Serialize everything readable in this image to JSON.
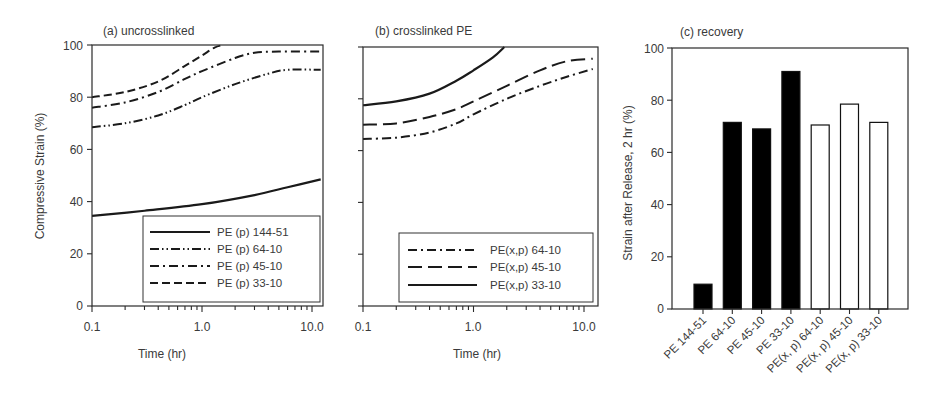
{
  "chart_data": [
    {
      "panel": "a",
      "type": "line",
      "title": "(a) uncrosslinked",
      "xlabel": "Time (hr)",
      "ylabel": "Compressive Strain (%)",
      "xscale": "log",
      "xlim": [
        0.1,
        12.6
      ],
      "ylim": [
        0,
        100
      ],
      "xticks": [
        "0.1",
        "1.0",
        "10.0"
      ],
      "yticks": [
        "0",
        "20",
        "40",
        "60",
        "80",
        "100"
      ],
      "grid": false,
      "legend_position": "lower right",
      "series": [
        {
          "name": "PE (p) 144-51",
          "style": "solid",
          "x": [
            0.1,
            0.3,
            1.0,
            3.0,
            6.0,
            12.0
          ],
          "y": [
            34.5,
            36.5,
            39,
            42.5,
            45.5,
            48.5
          ]
        },
        {
          "name": "PE (p) 64-10",
          "style": "dash-dot-dot",
          "x": [
            0.1,
            0.2,
            0.4,
            0.7,
            1.0,
            2.0,
            4.0,
            6.0,
            12.0
          ],
          "y": [
            68.5,
            70,
            73,
            77,
            80,
            85,
            89,
            90.5,
            90.5
          ]
        },
        {
          "name": "PE (p) 45-10",
          "style": "dash-dot",
          "x": [
            0.1,
            0.2,
            0.4,
            0.7,
            1.0,
            2.0,
            3.0,
            5.0,
            12.0
          ],
          "y": [
            76,
            78,
            82,
            87,
            90,
            95,
            97,
            97.5,
            97.5
          ]
        },
        {
          "name": "PE (p) 33-10",
          "style": "dashed",
          "x": [
            0.1,
            0.2,
            0.4,
            0.7,
            1.0,
            1.3,
            1.55
          ],
          "y": [
            80,
            82,
            86,
            92,
            96,
            99,
            100
          ]
        }
      ]
    },
    {
      "panel": "b",
      "type": "line",
      "title": "(b) crosslinked PE",
      "xlabel": "Time (hr)",
      "ylabel": "",
      "xscale": "log",
      "xlim": [
        0.1,
        13.4
      ],
      "ylim": [
        0,
        100
      ],
      "xticks": [
        "0.1",
        "1.0",
        "10.0"
      ],
      "grid": false,
      "legend_position": "lower right",
      "series": [
        {
          "name": "PE(x,p) 64-10",
          "style": "dash-dot",
          "x": [
            0.1,
            0.2,
            0.4,
            0.7,
            1.0,
            2.0,
            4.0,
            7.0,
            12.0
          ],
          "y": [
            64.5,
            65,
            67,
            70.5,
            74,
            80,
            85,
            88.5,
            91.5
          ]
        },
        {
          "name": "PE(x,p) 45-10",
          "style": "long-dash",
          "x": [
            0.1,
            0.2,
            0.4,
            0.7,
            1.0,
            2.0,
            4.0,
            7.0,
            12.0
          ],
          "y": [
            70,
            70.5,
            73,
            76,
            79,
            85,
            91,
            94.5,
            95.5
          ]
        },
        {
          "name": "PE(x,p) 33-10",
          "style": "solid",
          "x": [
            0.1,
            0.2,
            0.4,
            0.7,
            1.0,
            1.5,
            1.9
          ],
          "y": [
            77.5,
            79,
            82,
            87,
            91,
            96,
            100
          ]
        }
      ]
    },
    {
      "panel": "c",
      "type": "bar",
      "title": "(c) recovery",
      "xlabel": "",
      "ylabel": "Strain after Release, 2 hr (%)",
      "ylim": [
        0,
        100
      ],
      "yticks": [
        "0",
        "20",
        "40",
        "60",
        "80",
        "100"
      ],
      "grid": false,
      "categories": [
        "PE 144-51",
        "PE 64-10",
        "PE 45-10",
        "PE 33-10",
        "PE(x, p) 64-10",
        "PE(x, p) 45-10",
        "PE(x, p) 33-10"
      ],
      "values": [
        9.5,
        71.5,
        69,
        91,
        70.5,
        78.5,
        71.5
      ],
      "fills": [
        "black",
        "black",
        "black",
        "black",
        "white",
        "white",
        "white"
      ]
    }
  ],
  "panels": {
    "a": {
      "title": "(a) uncrosslinked",
      "xlabel": "Time (hr)",
      "ylabel": "Compressive Strain (%)",
      "xticks": [
        "0.1",
        "1.0",
        "10.0"
      ],
      "yticks": [
        "0",
        "20",
        "40",
        "60",
        "80",
        "100"
      ],
      "legend": [
        "PE (p) 144-51",
        "PE (p) 64-10",
        "PE (p) 45-10",
        "PE (p) 33-10"
      ]
    },
    "b": {
      "title": "(b) crosslinked PE",
      "xlabel": "Time (hr)",
      "xticks": [
        "0.1",
        "1.0",
        "10.0"
      ],
      "legend": [
        "PE(x,p) 64-10",
        "PE(x,p) 45-10",
        "PE(x,p) 33-10"
      ]
    },
    "c": {
      "title": "(c) recovery",
      "ylabel": "Strain after Release, 2 hr (%)",
      "yticks": [
        "0",
        "20",
        "40",
        "60",
        "80",
        "100"
      ],
      "categories": [
        "PE 144-51",
        "PE 64-10",
        "PE 45-10",
        "PE 33-10",
        "PE(x, p) 64-10",
        "PE(x, p) 45-10",
        "PE(x, p) 33-10"
      ]
    }
  },
  "colors": {
    "line": "#1a1a1a",
    "axis": "#2a2a2a",
    "text": "#3a3a3a",
    "bar_filled": "#000000",
    "bar_open": "#ffffff"
  }
}
